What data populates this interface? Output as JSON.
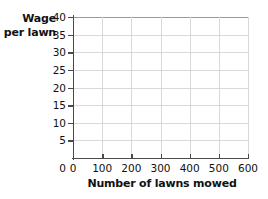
{
  "chart_data": {
    "type": "line",
    "title": "",
    "subtitle": "",
    "xlabel": "Number of lawns mowed",
    "ylabel": "Wage per lawn",
    "ylabel_line1": "Wage",
    "ylabel_line2": "per lawn",
    "xlim": [
      0,
      600
    ],
    "ylim": [
      0,
      40
    ],
    "xticks": [
      0,
      100,
      200,
      300,
      400,
      500,
      600
    ],
    "yticks": [
      0,
      5,
      10,
      15,
      20,
      25,
      30,
      35,
      40
    ],
    "xtick_labels": [
      "0",
      "100",
      "200",
      "300",
      "400",
      "500",
      "600"
    ],
    "ytick_labels": [
      "0",
      "5",
      "10",
      "15",
      "20",
      "25",
      "30",
      "35",
      "40"
    ],
    "grid": true,
    "grid_color": "#d9d9d9",
    "axis_color": "#4a4a4a",
    "background": "#ffffff",
    "legend": null,
    "legend_position": "none",
    "annotations": [],
    "series": [],
    "values": [],
    "x": [],
    "note": "Empty coordinate grid; no data plotted."
  }
}
